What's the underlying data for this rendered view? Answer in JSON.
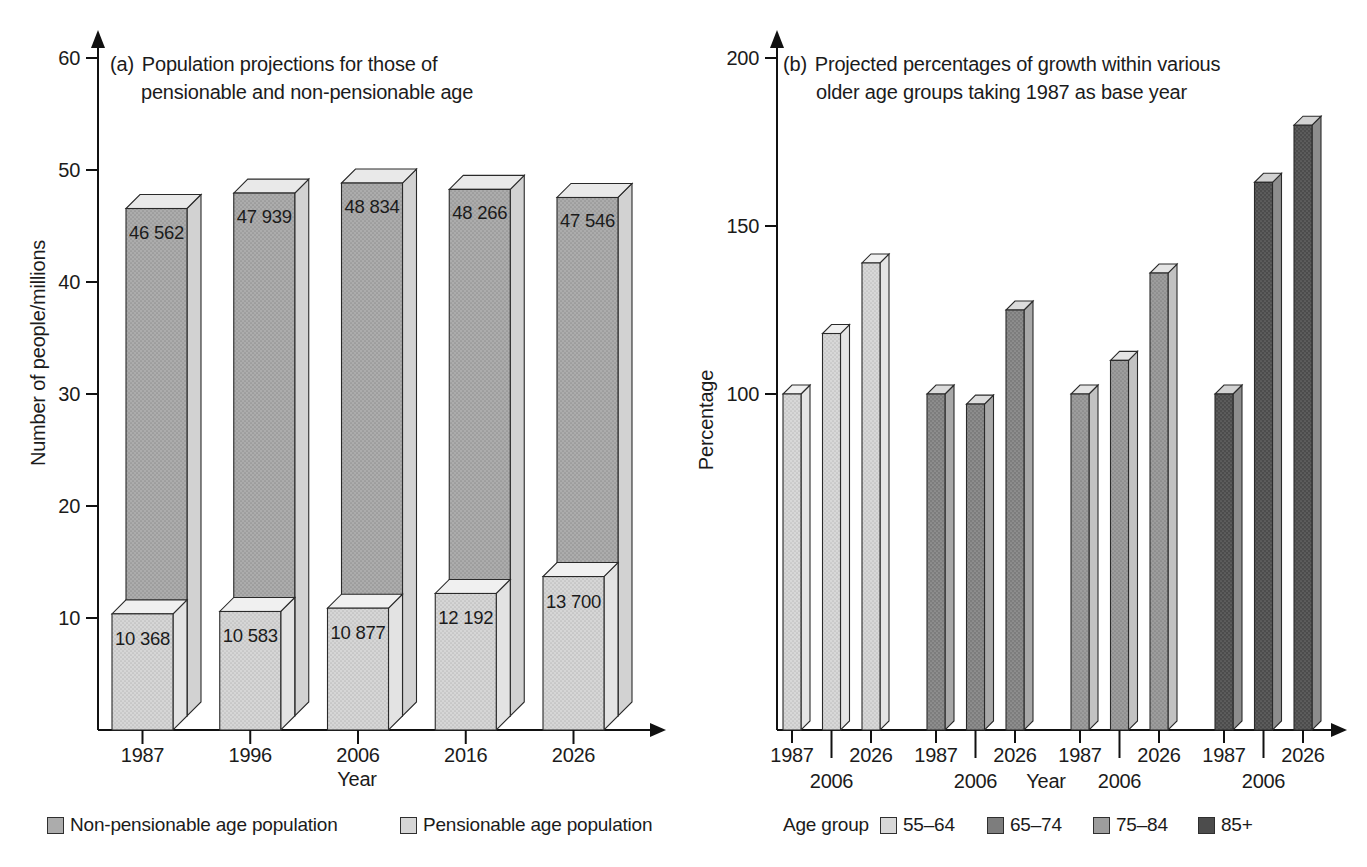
{
  "figure": {
    "background": "#ffffff",
    "charts": [
      {
        "id": "a",
        "title_prefix": "(a)",
        "title_line1": "Population projections for those of",
        "title_line2": "pensionable and non-pensionable age",
        "ylabel": "Number of people/millions",
        "xlabel": "Year",
        "legend": [
          {
            "label": "Non-pensionable age population"
          },
          {
            "label": "Pensionable age population"
          }
        ]
      },
      {
        "id": "b",
        "title_prefix": "(b)",
        "title_line1": "Projected percentages of growth within various",
        "title_line2": "older age groups taking 1987 as base year",
        "ylabel": "Percentage",
        "xlabel": "Year",
        "legend_title": "Age group",
        "legend": [
          {
            "label": "55–64"
          },
          {
            "label": "65–74"
          },
          {
            "label": "75–84"
          },
          {
            "label": "85+"
          }
        ]
      }
    ]
  },
  "chart_data": [
    {
      "type": "bar",
      "variant": "3d-overlapped-columns",
      "title": "(a) Population projections for those of pensionable and non-pensionable age",
      "xlabel": "Year",
      "ylabel": "Number of people/millions",
      "ylim": [
        0,
        60
      ],
      "yticks": [
        10,
        20,
        30,
        40,
        50,
        60
      ],
      "grid": false,
      "legend_position": "bottom",
      "categories": [
        "1987",
        "1996",
        "2006",
        "2016",
        "2026"
      ],
      "series": [
        {
          "name": "Non-pensionable age population",
          "unit": "thousands",
          "values": [
            46562,
            47939,
            48834,
            48266,
            47546
          ],
          "bar_labels": [
            "46 562",
            "47 939",
            "48 834",
            "48 266",
            "47 546"
          ],
          "axis_values_millions": [
            46.562,
            47.939,
            48.834,
            48.266,
            47.546
          ],
          "front_color": "#acacac",
          "side_color": "#d2d2d2",
          "top_color": "#e9e9e9"
        },
        {
          "name": "Pensionable age population",
          "unit": "thousands",
          "values": [
            10368,
            10583,
            10877,
            12192,
            13700
          ],
          "bar_labels": [
            "10 368",
            "10 583",
            "10 877",
            "12 192",
            "13 700"
          ],
          "axis_values_millions": [
            10.368,
            10.583,
            10.877,
            12.192,
            13.7
          ],
          "front_color": "#d6d6d6",
          "side_color": "#e3e3e3",
          "top_color": "#f0f0f0"
        }
      ]
    },
    {
      "type": "bar",
      "variant": "3d-grouped-columns",
      "title": "(b) Projected percentages of growth within various older age groups taking 1987 as base year",
      "xlabel": "Year",
      "ylabel": "Percentage",
      "ylim": [
        0,
        200
      ],
      "yticks": [
        100,
        150,
        200
      ],
      "grid": false,
      "legend_title": "Age group",
      "legend_position": "bottom",
      "categories": [
        "1987",
        "2006",
        "2026"
      ],
      "base_year_value": 100,
      "series": [
        {
          "name": "55–64",
          "values": [
            100,
            118,
            139
          ],
          "front_color": "#d8d8d8",
          "side_color": "#e5e5e5",
          "top_color": "#f0f0f0"
        },
        {
          "name": "65–74",
          "values": [
            100,
            97,
            125
          ],
          "front_color": "#7d7d7d",
          "side_color": "#a8a8a8",
          "top_color": "#dcdcdc"
        },
        {
          "name": "75–84",
          "values": [
            100,
            110,
            136
          ],
          "front_color": "#9d9d9d",
          "side_color": "#c2c2c2",
          "top_color": "#e4e4e4"
        },
        {
          "name": "85+",
          "values": [
            100,
            163,
            180
          ],
          "front_color": "#4c4c4c",
          "side_color": "#8d8d8d",
          "top_color": "#d2d2d2"
        }
      ]
    }
  ]
}
